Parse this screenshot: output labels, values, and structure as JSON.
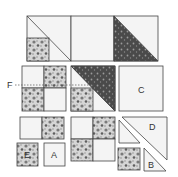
{
  "diagram": {
    "type": "quilt-block-assembly",
    "colors": {
      "background": "#ffffff",
      "outline": "#444444",
      "light_fabric": "#f2f2f2",
      "dark_fabric": "#4a4a4a",
      "dark_speckle": "#9a9a9a",
      "floral_fabric": "#c8c8c8",
      "floral_spot": "#6a6a6a"
    },
    "labels": {
      "F": "F",
      "C": "C",
      "D": "D",
      "A": "A",
      "E": "E",
      "B": "B"
    },
    "pieces": [
      {
        "id": "top-strip",
        "description": "assembled row: half-square unit with corner square, plain square, dark half-square triangle"
      },
      {
        "id": "unit-F",
        "description": "four-patch with fold line F"
      },
      {
        "id": "unit-center",
        "description": "dark triangle over four-patch half"
      },
      {
        "id": "piece-C",
        "description": "plain square C"
      },
      {
        "id": "two-patch",
        "description": "plain + floral rectangle"
      },
      {
        "id": "piece-E",
        "description": "floral square E"
      },
      {
        "id": "piece-A",
        "description": "plain square A"
      },
      {
        "id": "four-patch",
        "description": "four-patch unit"
      },
      {
        "id": "piece-D",
        "description": "large triangle D"
      },
      {
        "id": "small-triangle",
        "description": "small triangle"
      },
      {
        "id": "floral-square",
        "description": "small floral square"
      },
      {
        "id": "piece-B",
        "description": "small triangle B"
      }
    ]
  }
}
